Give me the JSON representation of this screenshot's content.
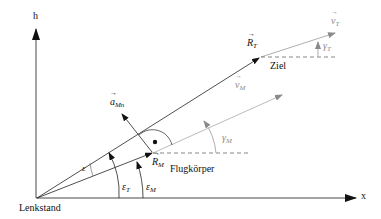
{
  "diagram": {
    "axes": {
      "h_label": "h",
      "x_label": "x"
    },
    "points": {
      "origin_label": "Lenkstand",
      "target_label": "Ziel",
      "missile_label": "Flugkörper"
    },
    "vectors": {
      "R_T": {
        "symbol": "R",
        "sub": "T"
      },
      "R_M": {
        "symbol": "R",
        "sub": "M"
      },
      "v_T": {
        "symbol": "v",
        "sub": "T"
      },
      "v_M": {
        "symbol": "v",
        "sub": "M"
      },
      "a_Mn": {
        "symbol": "a",
        "sub": "Mn"
      }
    },
    "angles": {
      "epsilon": "ε",
      "epsilon_T": {
        "symbol": "ε",
        "sub": "T"
      },
      "epsilon_M": {
        "symbol": "ε",
        "sub": "M"
      },
      "gamma_M": {
        "symbol": "γ",
        "sub": "M"
      },
      "gamma_T": {
        "symbol": "γ",
        "sub": "T"
      }
    },
    "colors": {
      "primary": "#111111",
      "secondary": "#8a8a8a"
    }
  }
}
